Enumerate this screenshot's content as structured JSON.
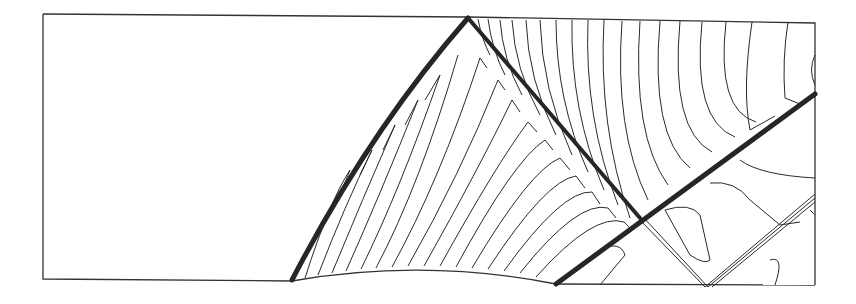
{
  "figure": {
    "type": "contour-plot",
    "colors": {
      "line": "#2a2a2a",
      "shock": "#262626",
      "background": "#ffffff",
      "frame": "#333333"
    },
    "frame": {
      "left": 43,
      "top": 14,
      "right": 815,
      "bottom": 285
    },
    "bump": {
      "x_start": 292,
      "x_end": 556,
      "peak_y": 271
    },
    "shocks": [
      {
        "name": "leading-edge-shock",
        "from": [
          292,
          280
        ],
        "to": [
          468,
          18
        ]
      },
      {
        "name": "reflected-shock",
        "from": [
          468,
          18
        ],
        "to": [
          640,
          220
        ]
      },
      {
        "name": "trailing-edge-shock",
        "from": [
          556,
          284
        ],
        "to": [
          815,
          94
        ]
      },
      {
        "name": "second-reflection",
        "from": [
          640,
          220
        ],
        "to": [
          705,
          287
        ]
      },
      {
        "name": "lower-wall-reflection",
        "from": [
          705,
          287
        ],
        "to": [
          815,
          192
        ]
      }
    ]
  }
}
